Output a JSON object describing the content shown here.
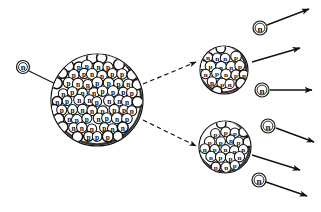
{
  "diagram": {
    "type": "nuclear-fission-schematic",
    "style": "hand-drawn line art, black ink on white",
    "canvas": {
      "width": 321,
      "height": 212,
      "background": "#ffffff"
    },
    "ink_color": "#111111"
  },
  "labels": {
    "neutron": "n",
    "proton": "p"
  },
  "incident_neutron": {
    "label": "n",
    "cx": 23,
    "cy": 67,
    "r": 6.5,
    "leader_line": {
      "x1": 29,
      "y1": 71,
      "x2": 72,
      "y2": 92
    }
  },
  "parent_nucleus": {
    "name": "heavy-nucleus",
    "cx": 97,
    "cy": 100,
    "r": 46,
    "nucleon_r": 5.2,
    "nucleon_count": 120,
    "composition": [
      "p",
      "n"
    ]
  },
  "fission_arrows": [
    {
      "name": "fission-path-upper",
      "x1": 143,
      "y1": 84,
      "x2": 196,
      "y2": 62,
      "dashed": true
    },
    {
      "name": "fission-path-lower",
      "x1": 143,
      "y1": 120,
      "x2": 196,
      "y2": 146,
      "dashed": true
    }
  ],
  "fragments": [
    {
      "name": "fragment-nucleus-upper",
      "cx": 224,
      "cy": 70,
      "r": 24,
      "nucleon_r": 5.0,
      "nucleon_count": 40
    },
    {
      "name": "fragment-nucleus-lower",
      "cx": 225,
      "cy": 147,
      "r": 26,
      "nucleon_r": 5.0,
      "nucleon_count": 44
    }
  ],
  "emitted_neutrons": [
    {
      "name": "emitted-neutron-1",
      "label": "n",
      "cx": 260,
      "cy": 28,
      "r": 7,
      "arrow": {
        "x1": 267,
        "y1": 25,
        "x2": 309,
        "y2": 9
      }
    },
    {
      "name": "emitted-neutron-2",
      "label": "n",
      "cx": 262,
      "cy": 90,
      "r": 7,
      "arrow": {
        "x1": 270,
        "y1": 90,
        "x2": 312,
        "y2": 90
      }
    },
    {
      "name": "emitted-neutron-3",
      "label": "n",
      "cx": 268,
      "cy": 126,
      "r": 7,
      "arrow": {
        "x1": 276,
        "y1": 128,
        "x2": 314,
        "y2": 142
      }
    },
    {
      "name": "emitted-neutron-4",
      "label": "n",
      "cx": 259,
      "cy": 180,
      "r": 7,
      "arrow": {
        "x1": 266,
        "y1": 182,
        "x2": 307,
        "y2": 196
      }
    }
  ],
  "fragment_arrows": [
    {
      "name": "fragment-momentum-arrow-upper",
      "x1": 252,
      "y1": 62,
      "x2": 300,
      "y2": 48
    },
    {
      "name": "fragment-momentum-arrow-lower",
      "x1": 252,
      "y1": 155,
      "x2": 300,
      "y2": 170
    }
  ]
}
